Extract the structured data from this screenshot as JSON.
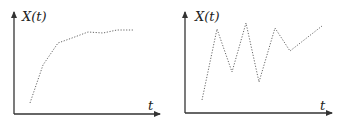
{
  "panels": [
    {
      "id": "left",
      "y_label": "X(t)",
      "x_label": "t",
      "description": "Monotonically increasing, saturating curve (dotted)",
      "axis_origin": [
        14,
        114
      ],
      "axis_x_end": 160,
      "axis_y_end": 12,
      "points": [
        [
          30,
          103
        ],
        [
          43,
          65
        ],
        [
          58,
          43
        ],
        [
          72,
          38
        ],
        [
          88,
          32
        ],
        [
          103,
          33
        ],
        [
          117,
          30
        ],
        [
          133,
          30
        ]
      ]
    },
    {
      "id": "right",
      "y_label": "X(t)",
      "x_label": "t",
      "description": "Oscillating zigzag curve (dotted)",
      "axis_origin": [
        185,
        113
      ],
      "axis_x_end": 332,
      "axis_y_end": 12,
      "points": [
        [
          202,
          100
        ],
        [
          217,
          29
        ],
        [
          232,
          72
        ],
        [
          246,
          23
        ],
        [
          259,
          82
        ],
        [
          275,
          28
        ],
        [
          290,
          51
        ],
        [
          322,
          26
        ]
      ]
    }
  ],
  "colors": {
    "axis": "#333333",
    "curve": "#555555",
    "background": "#ffffff"
  }
}
